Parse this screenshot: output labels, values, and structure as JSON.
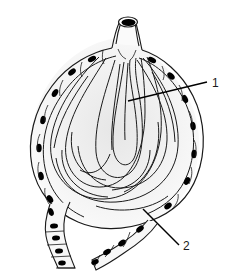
{
  "figure": {
    "type": "line-art anatomical illustration",
    "background_color": "#ffffff",
    "outline_color": "#1a1a1a",
    "fill_color": "#f7f7f7",
    "nucleus_color": "#000000",
    "shading_color": "#ececec",
    "width": 235,
    "height": 278
  },
  "labels": [
    {
      "id": "label-1",
      "text": "1",
      "x": 212,
      "y": 87,
      "leader": {
        "from_x": 207,
        "from_y": 82,
        "to_x": 128,
        "to_y": 101
      },
      "points_to": "secretory-tubule-lumen"
    },
    {
      "id": "label-2",
      "text": "2",
      "x": 183,
      "y": 250,
      "leader": {
        "from_x": 179,
        "from_y": 245,
        "to_x": 143,
        "to_y": 209
      },
      "points_to": "myoepithelial-wall-cell"
    }
  ],
  "parts": {
    "duct_opening": "excretory-duct-lumen",
    "duct_neck": "duct-neck",
    "acinus_body": "glandular-acinus-body",
    "tubule_loops": "coiled-secretory-tubules",
    "wall_epithelium": "spindle-epithelial-cell-layer",
    "lower_left_duct": "lower-left-duct-branch",
    "lower_right_duct": "lower-right-duct-branch",
    "cuboidal_cells": "cuboidal-duct-epithelium"
  },
  "nuclei_count": {
    "left_wall": 6,
    "right_wall": 6,
    "top_wall": 4,
    "lower_left_duct": 4,
    "lower_right_duct": 4
  }
}
